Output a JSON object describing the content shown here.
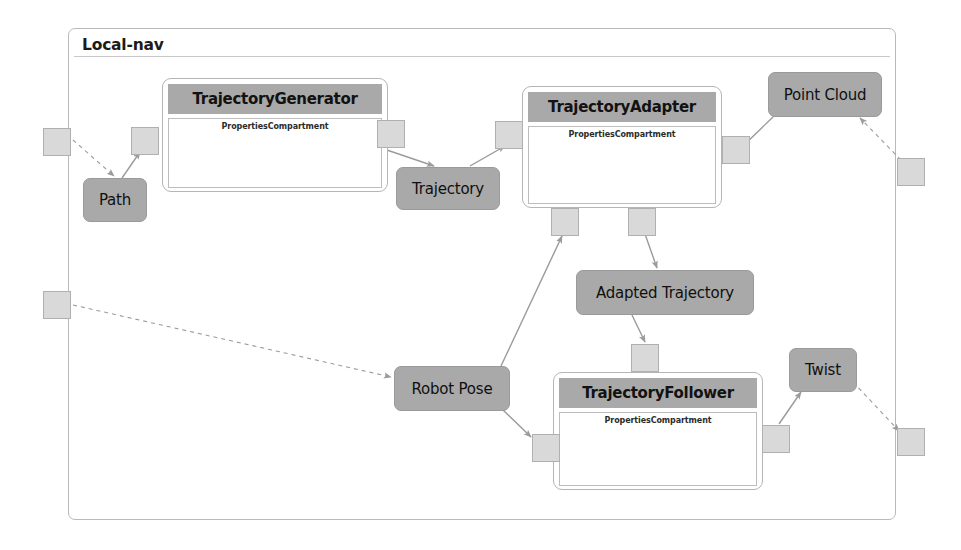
{
  "diagram": {
    "title": "Local-nav",
    "type": "uml-component-diagram",
    "colors": {
      "header_gray": "#a9a9a9",
      "node_gray": "#a9a9a9",
      "port_gray": "#d9d9d9",
      "frame_border": "#b9b9b9",
      "connector": "#9b9b9b",
      "text": "#101010"
    }
  },
  "components": [
    {
      "id": "trajectory-generator",
      "name": "TrajectoryGenerator",
      "compartment": "PropertiesCompartment",
      "x": 162,
      "y": 78,
      "w": 226,
      "h": 114,
      "title_size": 15
    },
    {
      "id": "trajectory-adapter",
      "name": "TrajectoryAdapter",
      "compartment": "PropertiesCompartment",
      "x": 522,
      "y": 86,
      "w": 200,
      "h": 122,
      "title_size": 15
    },
    {
      "id": "trajectory-follower",
      "name": "TrajectoryFollower",
      "compartment": "PropertiesCompartment",
      "x": 553,
      "y": 372,
      "w": 210,
      "h": 118,
      "title_size": 15
    }
  ],
  "nodes": [
    {
      "id": "path",
      "label": "Path",
      "x": 83,
      "y": 178,
      "w": 64,
      "h": 44,
      "font": 15
    },
    {
      "id": "trajectory",
      "label": "Trajectory",
      "x": 396,
      "y": 167,
      "w": 104,
      "h": 43,
      "font": 15
    },
    {
      "id": "point-cloud",
      "label": "Point Cloud",
      "x": 768,
      "y": 72,
      "w": 114,
      "h": 45,
      "font": 15
    },
    {
      "id": "adapted-trajectory",
      "label": "Adapted Trajectory",
      "x": 576,
      "y": 270,
      "w": 178,
      "h": 45,
      "font": 15
    },
    {
      "id": "robot-pose",
      "label": "Robot Pose",
      "x": 394,
      "y": 366,
      "w": 116,
      "h": 45,
      "font": 15
    },
    {
      "id": "twist",
      "label": "Twist",
      "x": 789,
      "y": 348,
      "w": 68,
      "h": 44,
      "font": 15
    }
  ],
  "ports": [
    {
      "id": "frame-port-left-top",
      "owner": "frame",
      "x": 43,
      "y": 128,
      "w": 28,
      "h": 28
    },
    {
      "id": "frame-port-left-bottom",
      "owner": "frame",
      "x": 43,
      "y": 291,
      "w": 28,
      "h": 28
    },
    {
      "id": "frame-port-right-top",
      "owner": "frame",
      "x": 897,
      "y": 158,
      "w": 28,
      "h": 28
    },
    {
      "id": "frame-port-right-bottom",
      "owner": "frame",
      "x": 897,
      "y": 428,
      "w": 28,
      "h": 28
    },
    {
      "id": "tg-port-left",
      "owner": "trajectory-generator",
      "x": 131,
      "y": 127,
      "w": 28,
      "h": 28
    },
    {
      "id": "tg-port-right",
      "owner": "trajectory-generator",
      "x": 377,
      "y": 120,
      "w": 28,
      "h": 28
    },
    {
      "id": "ta-port-left",
      "owner": "trajectory-adapter",
      "x": 495,
      "y": 121,
      "w": 28,
      "h": 28
    },
    {
      "id": "ta-port-right",
      "owner": "trajectory-adapter",
      "x": 722,
      "y": 136,
      "w": 28,
      "h": 28
    },
    {
      "id": "ta-port-bottom-left",
      "owner": "trajectory-adapter",
      "x": 551,
      "y": 208,
      "w": 28,
      "h": 28
    },
    {
      "id": "ta-port-bottom-right",
      "owner": "trajectory-adapter",
      "x": 628,
      "y": 208,
      "w": 28,
      "h": 28
    },
    {
      "id": "tf-port-top",
      "owner": "trajectory-follower",
      "x": 631,
      "y": 344,
      "w": 28,
      "h": 28
    },
    {
      "id": "tf-port-left",
      "owner": "trajectory-follower",
      "x": 532,
      "y": 434,
      "w": 28,
      "h": 28
    },
    {
      "id": "tf-port-right",
      "owner": "trajectory-follower",
      "x": 762,
      "y": 425,
      "w": 28,
      "h": 28
    }
  ],
  "connectors": [
    {
      "id": "c1",
      "from": "frame-port-left-top",
      "to": "path",
      "style": "dashed",
      "x1": 73,
      "y1": 140,
      "x2": 114,
      "y2": 176
    },
    {
      "id": "c2",
      "from": "path",
      "to": "tg-port-left",
      "style": "solid",
      "x1": 122,
      "y1": 178,
      "x2": 140,
      "y2": 152
    },
    {
      "id": "c3",
      "from": "tg-port-right",
      "to": "trajectory",
      "style": "solid",
      "x1": 381,
      "y1": 148,
      "x2": 434,
      "y2": 166
    },
    {
      "id": "c4",
      "from": "trajectory",
      "to": "ta-port-left",
      "style": "solid",
      "x1": 470,
      "y1": 166,
      "x2": 505,
      "y2": 146
    },
    {
      "id": "c5",
      "from": "frame-port-right-top",
      "to": "point-cloud",
      "style": "dashed",
      "x1": 901,
      "y1": 160,
      "x2": 860,
      "y2": 118
    },
    {
      "id": "c6",
      "from": "point-cloud",
      "to": "ta-port-right",
      "style": "solid",
      "x1": 774,
      "y1": 116,
      "x2": 742,
      "y2": 147
    },
    {
      "id": "c7",
      "from": "ta-port-bottom-right",
      "to": "adapted-trajectory",
      "style": "solid",
      "x1": 645,
      "y1": 234,
      "x2": 657,
      "y2": 268
    },
    {
      "id": "c8",
      "from": "adapted-trajectory",
      "to": "tf-port-top",
      "style": "solid",
      "x1": 632,
      "y1": 315,
      "x2": 645,
      "y2": 342
    },
    {
      "id": "c9",
      "from": "frame-port-left-bottom",
      "to": "robot-pose",
      "style": "dashed",
      "x1": 73,
      "y1": 305,
      "x2": 391,
      "y2": 377
    },
    {
      "id": "c10",
      "from": "robot-pose",
      "to": "ta-port-bottom-left",
      "style": "solid",
      "x1": 501,
      "y1": 366,
      "x2": 562,
      "y2": 236
    },
    {
      "id": "c11",
      "from": "robot-pose",
      "to": "tf-port-left",
      "style": "solid",
      "x1": 503,
      "y1": 410,
      "x2": 531,
      "y2": 437
    },
    {
      "id": "c12",
      "from": "tf-port-right",
      "to": "twist",
      "style": "solid",
      "x1": 779,
      "y1": 424,
      "x2": 801,
      "y2": 392
    },
    {
      "id": "c13",
      "from": "twist",
      "to": "frame-port-right-bottom",
      "style": "dashed",
      "x1": 853,
      "y1": 382,
      "x2": 899,
      "y2": 431
    }
  ],
  "frame": {
    "x": 68,
    "y": 28,
    "w": 828,
    "h": 492,
    "rule_y": 56,
    "title_x": 82,
    "title_y": 36
  }
}
